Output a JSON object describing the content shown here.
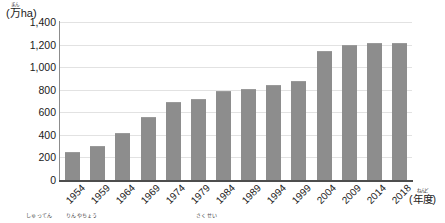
{
  "chart_data": {
    "type": "bar",
    "title": "",
    "subtitle": "",
    "ylabel": "(万ha)",
    "ylabel_ruby": "まん",
    "xlabel": "(年度)",
    "xlabel_ruby": "ねんど",
    "categories": [
      "1954",
      "1959",
      "1964",
      "1969",
      "1974",
      "1979",
      "1984",
      "1989",
      "1994",
      "1999",
      "2004",
      "2009",
      "2014",
      "2018"
    ],
    "values": [
      250,
      300,
      420,
      560,
      690,
      720,
      790,
      810,
      840,
      880,
      1140,
      1200,
      1210,
      1210
    ],
    "ylim": [
      0,
      1400
    ],
    "ytick_labels": [
      "0",
      "200",
      "400",
      "600",
      "800",
      "1,000",
      "1,200",
      "1,400"
    ],
    "ytick_values": [
      0,
      200,
      400,
      600,
      800,
      1000,
      1200,
      1400
    ],
    "grid": true,
    "legend": "none",
    "bar_color": "#8d8d8d",
    "gridline_color": "#e2e2e2",
    "axis_color": "#4d4d4d"
  },
  "footnotes": [
    {
      "text": "しゅってん",
      "x": 26
    },
    {
      "text": "りんやちょう",
      "x": 66
    },
    {
      "text": "さくせい",
      "x": 196
    }
  ]
}
